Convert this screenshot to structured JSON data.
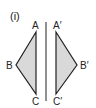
{
  "figure": {
    "label": "(i)",
    "mirror_line": {
      "x": 46,
      "y1": 22,
      "y2": 101
    },
    "colors": {
      "fill": "#d9d9d9",
      "stroke": "#222222",
      "background": "#ffffff"
    },
    "original_triangle": {
      "vertices": [
        {
          "name": "A",
          "label": "A",
          "x": 36,
          "y": 32
        },
        {
          "name": "B",
          "label": "B",
          "x": 16,
          "y": 65
        },
        {
          "name": "C",
          "label": "C",
          "x": 36,
          "y": 94
        }
      ]
    },
    "reflected_triangle": {
      "vertices": [
        {
          "name": "A'",
          "label": "A′",
          "x": 56,
          "y": 32
        },
        {
          "name": "B'",
          "label": "B′",
          "x": 77,
          "y": 65
        },
        {
          "name": "C'",
          "label": "C′",
          "x": 56,
          "y": 94
        }
      ]
    }
  }
}
